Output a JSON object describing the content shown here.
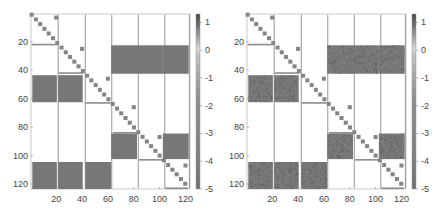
{
  "chart_data": [
    {
      "type": "heatmap",
      "title": "",
      "xlabel": "",
      "ylabel": "",
      "xlim": [
        0.5,
        123.5
      ],
      "ylim": [
        0.5,
        123.5
      ],
      "x_ticks": [
        20,
        40,
        60,
        80,
        100,
        120
      ],
      "y_ticks": [
        20,
        40,
        60,
        80,
        100,
        120
      ],
      "colorbar": {
        "ticks": [
          1,
          0,
          -1,
          -2,
          -3,
          -4,
          -5
        ],
        "range": [
          -5,
          1.3
        ],
        "colormap": "gray"
      },
      "grid": false,
      "texture": "smooth",
      "group_boundaries": [
        21.5,
        42.5,
        63,
        83.5,
        104
      ],
      "blocks": [
        {
          "rows": [
            23,
            42
          ],
          "cols": [
            63,
            82
          ],
          "value": -1.5
        },
        {
          "rows": [
            23,
            42
          ],
          "cols": [
            83,
            102
          ],
          "value": -1.5
        },
        {
          "rows": [
            23,
            42
          ],
          "cols": [
            103,
            122
          ],
          "value": -1.5
        },
        {
          "rows": [
            44,
            62
          ],
          "cols": [
            2,
            20
          ],
          "value": -1.5
        },
        {
          "rows": [
            44,
            62
          ],
          "cols": [
            22,
            40
          ],
          "value": -1.5
        },
        {
          "rows": [
            85,
            102
          ],
          "cols": [
            63,
            82
          ],
          "value": -1.5
        },
        {
          "rows": [
            85,
            102
          ],
          "cols": [
            103,
            122
          ],
          "value": -1.5
        },
        {
          "rows": [
            105,
            123
          ],
          "cols": [
            2,
            20
          ],
          "value": -1.5
        },
        {
          "rows": [
            105,
            123
          ],
          "cols": [
            22,
            40
          ],
          "value": -1.5
        },
        {
          "rows": [
            105,
            123
          ],
          "cols": [
            43,
            62
          ],
          "value": -1.5
        }
      ],
      "off_diagonal_points": [
        {
          "row": 3,
          "col": 20
        },
        {
          "row": 25,
          "col": 40
        },
        {
          "row": 46,
          "col": 60
        },
        {
          "row": 66,
          "col": 80
        },
        {
          "row": 87,
          "col": 100
        },
        {
          "row": 107,
          "col": 120
        }
      ]
    },
    {
      "type": "heatmap",
      "title": "",
      "xlabel": "",
      "ylabel": "",
      "xlim": [
        0.5,
        123.5
      ],
      "ylim": [
        0.5,
        123.5
      ],
      "x_ticks": [
        20,
        40,
        60,
        80,
        100,
        120
      ],
      "y_ticks": [
        20,
        40,
        60,
        80,
        100,
        120
      ],
      "colorbar": {
        "ticks": [
          1,
          0,
          -1,
          -2,
          -3,
          -4,
          -5
        ],
        "range": [
          -5,
          1.3
        ],
        "colormap": "gray"
      },
      "grid": false,
      "texture": "noisy",
      "group_boundaries": [
        21.5,
        42.5,
        63,
        83.5,
        104
      ],
      "blocks": [
        {
          "rows": [
            23,
            42
          ],
          "cols": [
            63,
            82
          ],
          "value": -1.6
        },
        {
          "rows": [
            23,
            42
          ],
          "cols": [
            83,
            102
          ],
          "value": -1.6
        },
        {
          "rows": [
            23,
            42
          ],
          "cols": [
            103,
            122
          ],
          "value": -1.6
        },
        {
          "rows": [
            44,
            62
          ],
          "cols": [
            2,
            20
          ],
          "value": -1.6
        },
        {
          "rows": [
            44,
            62
          ],
          "cols": [
            22,
            40
          ],
          "value": -1.6
        },
        {
          "rows": [
            85,
            102
          ],
          "cols": [
            63,
            82
          ],
          "value": -1.6
        },
        {
          "rows": [
            85,
            102
          ],
          "cols": [
            103,
            122
          ],
          "value": -1.6
        },
        {
          "rows": [
            105,
            123
          ],
          "cols": [
            2,
            20
          ],
          "value": -1.6
        },
        {
          "rows": [
            105,
            123
          ],
          "cols": [
            22,
            40
          ],
          "value": -1.6
        },
        {
          "rows": [
            105,
            123
          ],
          "cols": [
            43,
            62
          ],
          "value": -1.6
        }
      ],
      "off_diagonal_points": [
        {
          "row": 3,
          "col": 20
        },
        {
          "row": 25,
          "col": 40
        },
        {
          "row": 46,
          "col": 60
        },
        {
          "row": 66,
          "col": 80
        },
        {
          "row": 87,
          "col": 100
        },
        {
          "row": 107,
          "col": 120
        }
      ]
    }
  ],
  "layout": {
    "panels": [
      {
        "left": 0,
        "ax_x0": 31,
        "ax_y0": 14,
        "ax_w": 159,
        "ax_h": 175,
        "cb_x": 196
      },
      {
        "left": 221,
        "ax_x0": 26,
        "ax_y0": 14,
        "ax_w": 159,
        "ax_h": 175,
        "cb_x": 191
      }
    ],
    "colors": {
      "block": "#777777",
      "diag": "#858585",
      "line": "#8a8a8a",
      "axis": "#bbbbbb",
      "text": "#444444"
    }
  }
}
